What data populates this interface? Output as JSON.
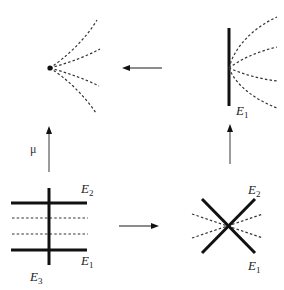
{
  "diagram": {
    "panels": {
      "top_left": {
        "description": "point with curves through it (blown-down)",
        "point": {
          "x": 50,
          "y": 68
        },
        "curves": 4
      },
      "top_right": {
        "description": "exceptional divisor with transversal curves",
        "divisor_label": "E",
        "divisor_sub": "1",
        "curves": 4
      },
      "bottom_left": {
        "description": "three exceptional curves, two horizontal dashed curves",
        "labels": [
          {
            "main": "E",
            "sub": "2"
          },
          {
            "main": "E",
            "sub": "1"
          },
          {
            "main": "E",
            "sub": "3"
          }
        ],
        "dashed_lines": 2
      },
      "bottom_right": {
        "description": "two crossing divisors with dashed curves through crossing",
        "labels": [
          {
            "main": "E",
            "sub": "2"
          },
          {
            "main": "E",
            "sub": "1"
          }
        ],
        "dashed_lines": 2
      }
    },
    "arrows": {
      "top": {
        "direction": "left"
      },
      "bottom": {
        "direction": "right"
      },
      "left": {
        "direction": "up",
        "label": "μ"
      },
      "right": {
        "direction": "up"
      }
    },
    "colors": {
      "ink": "#111111",
      "arrow": "#666666",
      "background": "#ffffff"
    }
  }
}
